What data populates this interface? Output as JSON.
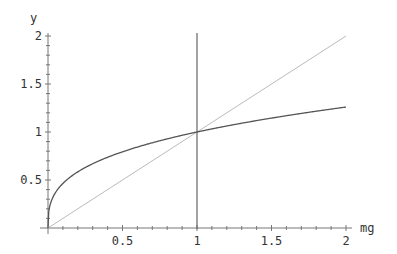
{
  "chart_data": {
    "type": "line",
    "title": "",
    "xlabel": "mg",
    "ylabel": "y",
    "xlim": [
      0,
      2
    ],
    "ylim": [
      0,
      2
    ],
    "grid": false,
    "legend": null,
    "x_ticks": [
      "0.5",
      "1",
      "1.5",
      "2"
    ],
    "y_ticks": [
      "0.5",
      "1",
      "1.5",
      "2"
    ],
    "series": [
      {
        "name": "power curve (y = mg^(1/3))",
        "color": "#555555",
        "x": [
          0,
          0.01,
          0.05,
          0.1,
          0.25,
          0.5,
          0.75,
          1,
          1.25,
          1.5,
          1.75,
          2
        ],
        "values": [
          0,
          0.22,
          0.37,
          0.46,
          0.63,
          0.79,
          0.91,
          1.0,
          1.08,
          1.14,
          1.21,
          1.26
        ]
      },
      {
        "name": "identity line (y = mg)",
        "color": "#bbbbbb",
        "x": [
          0,
          2
        ],
        "values": [
          0,
          2
        ]
      },
      {
        "name": "vertical line (mg = 1)",
        "color": "#666666",
        "x": [
          1,
          1
        ],
        "values": [
          0,
          2.05
        ]
      }
    ]
  }
}
